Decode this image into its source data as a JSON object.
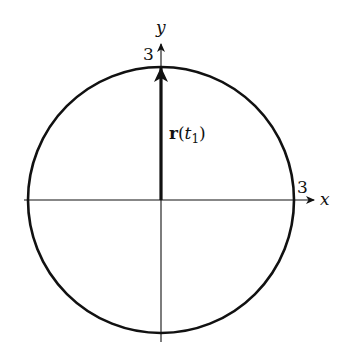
{
  "diagram": {
    "axes": {
      "x_label": "x",
      "y_label": "y",
      "x_tick_label": "3",
      "y_tick_label": "3"
    },
    "circle": {
      "radius": 3,
      "center": [
        0,
        0
      ]
    },
    "vector": {
      "name": "r",
      "open_paren": "(",
      "param": "t",
      "subscript": "1",
      "close_paren": ")",
      "from": [
        0,
        0
      ],
      "to": [
        0,
        3
      ]
    },
    "colors": {
      "stroke": "#111111",
      "background": "#ffffff"
    }
  }
}
